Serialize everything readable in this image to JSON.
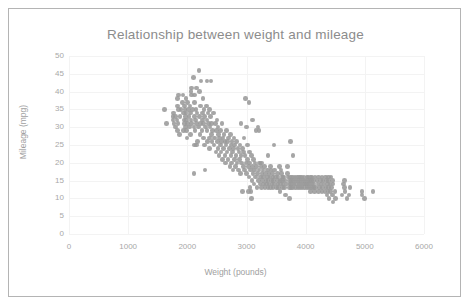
{
  "chart_data": {
    "type": "scatter",
    "title": "Relationship between weight and mileage",
    "xlabel": "Weight (pounds)",
    "ylabel": "Mileage (mpg)",
    "xlim": [
      0,
      6000
    ],
    "ylim": [
      0,
      50
    ],
    "xticks": [
      "0",
      "1000",
      "2000",
      "3000",
      "4000",
      "5000",
      "6000"
    ],
    "yticks": [
      "0",
      "5",
      "10",
      "15",
      "20",
      "25",
      "30",
      "35",
      "40",
      "45",
      "50"
    ],
    "xtick_step": 1000,
    "ytick_step": 5,
    "grid": true,
    "legend": "none",
    "marker_color": "#9a9a9a",
    "marker_shape": "circle",
    "point_count": 392,
    "correlation": "negative",
    "series_name": "Vehicles",
    "points": [
      [
        1613,
        35
      ],
      [
        1649,
        31
      ],
      [
        1755,
        33
      ],
      [
        1760,
        32
      ],
      [
        1765,
        34
      ],
      [
        1773,
        31
      ],
      [
        1795,
        33
      ],
      [
        1800,
        30
      ],
      [
        1825,
        32
      ],
      [
        1834,
        29
      ],
      [
        1835,
        36
      ],
      [
        1836,
        38
      ],
      [
        1845,
        31
      ],
      [
        1850,
        35
      ],
      [
        1867,
        28
      ],
      [
        1875,
        33
      ],
      [
        1915,
        37
      ],
      [
        1925,
        39
      ],
      [
        1937,
        34
      ],
      [
        1940,
        29
      ],
      [
        1945,
        32
      ],
      [
        1950,
        36
      ],
      [
        1955,
        31
      ],
      [
        1963,
        35
      ],
      [
        1968,
        33
      ],
      [
        1970,
        30
      ],
      [
        1975,
        38
      ],
      [
        1980,
        34
      ],
      [
        1985,
        29
      ],
      [
        1990,
        32
      ],
      [
        1995,
        27
      ],
      [
        2000,
        37
      ],
      [
        2003,
        31
      ],
      [
        2019,
        35
      ],
      [
        2025,
        33
      ],
      [
        2035,
        30
      ],
      [
        2045,
        36
      ],
      [
        2050,
        28
      ],
      [
        2055,
        34
      ],
      [
        2065,
        32
      ],
      [
        2070,
        39
      ],
      [
        2075,
        31
      ],
      [
        2085,
        35
      ],
      [
        2100,
        44
      ],
      [
        2110,
        30
      ],
      [
        2120,
        33
      ],
      [
        2125,
        37
      ],
      [
        2130,
        29
      ],
      [
        2135,
        32
      ],
      [
        2144,
        35
      ],
      [
        2150,
        41
      ],
      [
        2155,
        31
      ],
      [
        2164,
        34
      ],
      [
        2171,
        26
      ],
      [
        2189,
        30
      ],
      [
        2200,
        46
      ],
      [
        2205,
        33
      ],
      [
        2210,
        40
      ],
      [
        2215,
        28
      ],
      [
        2220,
        36
      ],
      [
        2226,
        31
      ],
      [
        2230,
        43
      ],
      [
        2245,
        29
      ],
      [
        2254,
        34
      ],
      [
        2260,
        32
      ],
      [
        2265,
        38
      ],
      [
        2270,
        27
      ],
      [
        2275,
        31
      ],
      [
        2279,
        35
      ],
      [
        2288,
        25
      ],
      [
        2295,
        33
      ],
      [
        2300,
        18
      ],
      [
        2310,
        30
      ],
      [
        2320,
        36
      ],
      [
        2330,
        29
      ],
      [
        2335,
        32
      ],
      [
        2340,
        26
      ],
      [
        2350,
        34
      ],
      [
        2360,
        31
      ],
      [
        2370,
        27
      ],
      [
        2375,
        35
      ],
      [
        2379,
        24
      ],
      [
        2385,
        30
      ],
      [
        2395,
        33
      ],
      [
        2400,
        43
      ],
      [
        2405,
        28
      ],
      [
        2410,
        31
      ],
      [
        2420,
        26
      ],
      [
        2430,
        29
      ],
      [
        2440,
        34
      ],
      [
        2451,
        25
      ],
      [
        2464,
        27
      ],
      [
        2472,
        31
      ],
      [
        2485,
        23
      ],
      [
        2490,
        29
      ],
      [
        2500,
        32
      ],
      [
        2506,
        26
      ],
      [
        2515,
        24
      ],
      [
        2520,
        30
      ],
      [
        2525,
        28
      ],
      [
        2535,
        22
      ],
      [
        2542,
        27
      ],
      [
        2556,
        25
      ],
      [
        2565,
        29
      ],
      [
        2572,
        23
      ],
      [
        2579,
        26
      ],
      [
        2587,
        31
      ],
      [
        2595,
        21
      ],
      [
        2605,
        27
      ],
      [
        2614,
        24
      ],
      [
        2620,
        28
      ],
      [
        2634,
        22
      ],
      [
        2640,
        26
      ],
      [
        2648,
        20
      ],
      [
        2655,
        25
      ],
      [
        2660,
        29
      ],
      [
        2670,
        23
      ],
      [
        2678,
        26
      ],
      [
        2690,
        21
      ],
      [
        2700,
        27
      ],
      [
        2711,
        24
      ],
      [
        2720,
        19
      ],
      [
        2725,
        28
      ],
      [
        2735,
        22
      ],
      [
        2740,
        25
      ],
      [
        2750,
        20
      ],
      [
        2755,
        26
      ],
      [
        2765,
        23
      ],
      [
        2774,
        18
      ],
      [
        2780,
        24
      ],
      [
        2789,
        27
      ],
      [
        2795,
        21
      ],
      [
        2800,
        25
      ],
      [
        2815,
        19
      ],
      [
        2825,
        22
      ],
      [
        2830,
        26
      ],
      [
        2840,
        20
      ],
      [
        2855,
        24
      ],
      [
        2865,
        18
      ],
      [
        2870,
        23
      ],
      [
        2880,
        21
      ],
      [
        2890,
        25
      ],
      [
        2900,
        17
      ],
      [
        2905,
        22
      ],
      [
        2910,
        31
      ],
      [
        2920,
        20
      ],
      [
        2930,
        24
      ],
      [
        2945,
        19
      ],
      [
        2950,
        23
      ],
      [
        2957,
        27
      ],
      [
        2965,
        18
      ],
      [
        2975,
        22
      ],
      [
        2984,
        38
      ],
      [
        2990,
        20
      ],
      [
        3000,
        30
      ],
      [
        3005,
        17
      ],
      [
        3012,
        21
      ],
      [
        3021,
        25
      ],
      [
        3035,
        19
      ],
      [
        3039,
        37
      ],
      [
        3045,
        16
      ],
      [
        3048,
        23
      ],
      [
        3055,
        20
      ],
      [
        3060,
        13
      ],
      [
        3070,
        18
      ],
      [
        3085,
        22
      ],
      [
        3090,
        15
      ],
      [
        3100,
        19
      ],
      [
        3102,
        32
      ],
      [
        3110,
        17
      ],
      [
        3120,
        21
      ],
      [
        3130,
        14
      ],
      [
        3139,
        18
      ],
      [
        3145,
        20
      ],
      [
        3155,
        16
      ],
      [
        3160,
        29
      ],
      [
        3169,
        19
      ],
      [
        3175,
        13
      ],
      [
        3190,
        17
      ],
      [
        3193,
        30
      ],
      [
        3205,
        15
      ],
      [
        3210,
        18
      ],
      [
        3211,
        29
      ],
      [
        3220,
        20
      ],
      [
        3230,
        14
      ],
      [
        3233,
        16
      ],
      [
        3245,
        19
      ],
      [
        3250,
        13
      ],
      [
        3264,
        17
      ],
      [
        3270,
        15
      ],
      [
        3278,
        18
      ],
      [
        3285,
        14
      ],
      [
        3290,
        16
      ],
      [
        3302,
        19
      ],
      [
        3310,
        13
      ],
      [
        3320,
        17
      ],
      [
        3329,
        15
      ],
      [
        3336,
        14
      ],
      [
        3350,
        18
      ],
      [
        3353,
        16
      ],
      [
        3360,
        13
      ],
      [
        3365,
        15
      ],
      [
        3380,
        17
      ],
      [
        3381,
        14
      ],
      [
        3399,
        16
      ],
      [
        3410,
        13
      ],
      [
        3415,
        18
      ],
      [
        3425,
        15
      ],
      [
        3432,
        14
      ],
      [
        3439,
        17
      ],
      [
        3445,
        16
      ],
      [
        3449,
        13
      ],
      [
        3459,
        15
      ],
      [
        3465,
        25
      ],
      [
        3470,
        14
      ],
      [
        3475,
        18
      ],
      [
        3490,
        16
      ],
      [
        3504,
        13
      ],
      [
        3520,
        15
      ],
      [
        3525,
        17
      ],
      [
        3530,
        14
      ],
      [
        3535,
        16
      ],
      [
        3545,
        13
      ],
      [
        3563,
        12
      ],
      [
        3570,
        15
      ],
      [
        3574,
        14
      ],
      [
        3590,
        17
      ],
      [
        3605,
        16
      ],
      [
        3609,
        13
      ],
      [
        3613,
        15
      ],
      [
        3620,
        14
      ],
      [
        3630,
        16
      ],
      [
        3645,
        13
      ],
      [
        3651,
        15
      ],
      [
        3664,
        11
      ],
      [
        3672,
        14
      ],
      [
        3693,
        17
      ],
      [
        3700,
        16
      ],
      [
        3725,
        13
      ],
      [
        3730,
        15
      ],
      [
        3735,
        14
      ],
      [
        3740,
        26
      ],
      [
        3745,
        16
      ],
      [
        3755,
        13
      ],
      [
        3760,
        15
      ],
      [
        3765,
        14
      ],
      [
        3777,
        16
      ],
      [
        3780,
        13
      ],
      [
        3785,
        22
      ],
      [
        3791,
        15
      ],
      [
        3800,
        14
      ],
      [
        3820,
        16
      ],
      [
        3830,
        13
      ],
      [
        3840,
        15
      ],
      [
        3850,
        14
      ],
      [
        3860,
        16
      ],
      [
        3870,
        13
      ],
      [
        3880,
        15
      ],
      [
        3890,
        14
      ],
      [
        3900,
        16
      ],
      [
        3907,
        13
      ],
      [
        3910,
        15
      ],
      [
        3920,
        14
      ],
      [
        3930,
        16
      ],
      [
        3940,
        13
      ],
      [
        3955,
        15
      ],
      [
        3962,
        14
      ],
      [
        3970,
        16
      ],
      [
        3985,
        13
      ],
      [
        3988,
        15
      ],
      [
        4000,
        14
      ],
      [
        4020,
        16
      ],
      [
        4025,
        13
      ],
      [
        4030,
        15
      ],
      [
        4035,
        14
      ],
      [
        4042,
        16
      ],
      [
        4054,
        13
      ],
      [
        4060,
        15
      ],
      [
        4065,
        14
      ],
      [
        4080,
        12
      ],
      [
        4082,
        16
      ],
      [
        4096,
        13
      ],
      [
        4100,
        15
      ],
      [
        4104,
        14
      ],
      [
        4110,
        16
      ],
      [
        4129,
        13
      ],
      [
        4135,
        15
      ],
      [
        4140,
        14
      ],
      [
        4154,
        12
      ],
      [
        4160,
        16
      ],
      [
        4165,
        13
      ],
      [
        4190,
        15
      ],
      [
        4209,
        14
      ],
      [
        4215,
        12
      ],
      [
        4220,
        16
      ],
      [
        4237,
        13
      ],
      [
        4250,
        15
      ],
      [
        4257,
        14
      ],
      [
        4274,
        12
      ],
      [
        4278,
        16
      ],
      [
        4288,
        13
      ],
      [
        4295,
        15
      ],
      [
        4312,
        14
      ],
      [
        4325,
        12
      ],
      [
        4335,
        16
      ],
      [
        4341,
        13
      ],
      [
        4354,
        15
      ],
      [
        4360,
        11
      ],
      [
        4364,
        14
      ],
      [
        4376,
        12
      ],
      [
        4382,
        16
      ],
      [
        4385,
        13
      ],
      [
        4390,
        15
      ],
      [
        4396,
        10
      ],
      [
        4410,
        14
      ],
      [
        4422,
        12
      ],
      [
        4425,
        16
      ],
      [
        4440,
        13
      ],
      [
        4449,
        11
      ],
      [
        4456,
        15
      ],
      [
        4464,
        14
      ],
      [
        4498,
        12
      ],
      [
        4502,
        10
      ],
      [
        4615,
        11
      ],
      [
        4638,
        14
      ],
      [
        4654,
        13
      ],
      [
        4657,
        15
      ],
      [
        4668,
        12
      ],
      [
        4699,
        10
      ],
      [
        4735,
        11
      ],
      [
        4746,
        13
      ],
      [
        4951,
        11
      ],
      [
        4952,
        12
      ],
      [
        4997,
        10
      ],
      [
        5140,
        12
      ],
      [
        2110,
        17
      ],
      [
        2155,
        25
      ],
      [
        2125,
        25
      ],
      [
        2330,
        43
      ],
      [
        3085,
        10
      ],
      [
        3730,
        10
      ],
      [
        4464,
        9
      ],
      [
        2065,
        40
      ],
      [
        2075,
        41
      ],
      [
        2120,
        39
      ],
      [
        1850,
        39
      ],
      [
        1890,
        35
      ],
      [
        3250,
        20
      ],
      [
        3360,
        22
      ],
      [
        3410,
        19
      ],
      [
        3555,
        19
      ],
      [
        3580,
        18
      ],
      [
        3690,
        19
      ],
      [
        2935,
        12
      ],
      [
        3030,
        12
      ],
      [
        3075,
        12
      ]
    ]
  }
}
